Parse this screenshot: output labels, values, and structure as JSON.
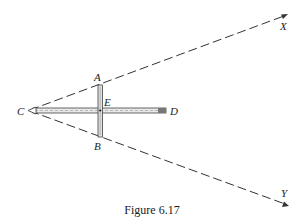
{
  "figure": {
    "caption": "Figure 6.17",
    "labels": {
      "A": "A",
      "B": "B",
      "C": "C",
      "D": "D",
      "E": "E",
      "X": "X",
      "Y": "Y"
    }
  }
}
